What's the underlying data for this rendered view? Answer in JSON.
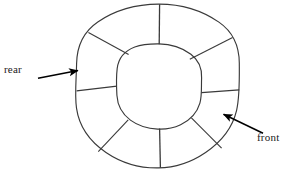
{
  "figure": {
    "background_color": "#ffffff",
    "stroke_color": "#3a3a3a",
    "arrow_color": "#000000"
  },
  "annulus": {
    "center_x": 158,
    "center_y": 86,
    "outer_radius": 82,
    "inner_radius": 42,
    "segment_count": 8,
    "spoke_angles_deg": [
      90,
      152,
      185,
      228,
      270,
      312,
      356,
      28
    ]
  },
  "labels": {
    "rear": "rear",
    "front": "front"
  },
  "annotations": [
    {
      "name": "rear-arrow",
      "label": "rear",
      "tail_x": 38,
      "tail_y": 78,
      "head_x": 82,
      "head_y": 70
    },
    {
      "name": "front-arrow",
      "label": "front",
      "tail_x": 263,
      "tail_y": 133,
      "head_x": 219,
      "head_y": 112
    }
  ]
}
